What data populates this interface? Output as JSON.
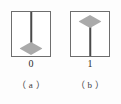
{
  "figure": {
    "title": "",
    "background_color": "#fdfdfd",
    "border_color": "#6e6e6e",
    "stem_color": "#4a4a4a",
    "diamond_color": "#aaaaaa",
    "panels": [
      {
        "id": "panel-a",
        "value_label": "0",
        "caption": "（ a ）",
        "diamond_position": "bottom",
        "stem_from": "top-edge",
        "stem_to": "diamond"
      },
      {
        "id": "panel-b",
        "value_label": "1",
        "caption": "（ b ）",
        "diamond_position": "top",
        "stem_from": "diamond",
        "stem_to": "bottom-edge"
      }
    ]
  }
}
